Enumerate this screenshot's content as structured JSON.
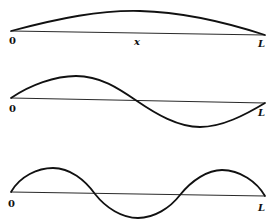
{
  "figure": {
    "panels": [
      {
        "mode": 1,
        "labels": {
          "start": "0",
          "middle": "x",
          "end": "L"
        }
      },
      {
        "mode": 2,
        "labels": {
          "start": "0",
          "end": "L"
        }
      },
      {
        "mode": 3,
        "labels": {
          "start": "0",
          "end": "L"
        }
      }
    ],
    "colors": {
      "stroke": "#111111",
      "axis": "#2a2a2a",
      "background": "#ffffff"
    }
  }
}
